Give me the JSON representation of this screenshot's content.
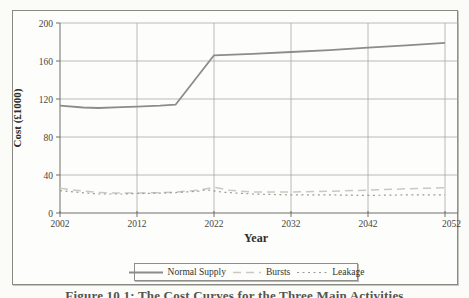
{
  "colors": {
    "paper": "#fbfbf8",
    "plot_background": "#fdfdfb",
    "gridline": "#a4a49e",
    "axis": "#6f6f69",
    "text": "#3c3c38"
  },
  "chart_data": {
    "type": "line",
    "title": "",
    "xlabel": "Year",
    "ylabel": "Cost (£1000)",
    "xlim": [
      2002,
      2052
    ],
    "ylim": [
      0,
      200
    ],
    "xticks": [
      2002,
      2012,
      2022,
      2032,
      2042,
      2052
    ],
    "yticks": [
      0,
      40,
      80,
      120,
      160,
      200
    ],
    "grid": "on",
    "legend_position": "bottom-center",
    "series": [
      {
        "name": "Normal Supply",
        "color": "#8c8c88",
        "dash": "",
        "width": 1.8,
        "points": [
          [
            2002,
            113
          ],
          [
            2005,
            111
          ],
          [
            2007,
            110.5
          ],
          [
            2010,
            111.5
          ],
          [
            2012,
            112
          ],
          [
            2015,
            113
          ],
          [
            2017,
            114
          ],
          [
            2022,
            166
          ],
          [
            2027,
            167.5
          ],
          [
            2032,
            169.5
          ],
          [
            2037,
            171.5
          ],
          [
            2042,
            174
          ],
          [
            2047,
            176.5
          ],
          [
            2052,
            179
          ]
        ]
      },
      {
        "name": "Bursts",
        "color": "#c9c9c3",
        "dash": "8 5",
        "width": 1.5,
        "points": [
          [
            2002,
            26
          ],
          [
            2004,
            24
          ],
          [
            2007,
            21.5
          ],
          [
            2010,
            21
          ],
          [
            2012,
            21
          ],
          [
            2015,
            21.5
          ],
          [
            2017,
            22
          ],
          [
            2020,
            24
          ],
          [
            2022,
            27
          ],
          [
            2024,
            24
          ],
          [
            2027,
            22
          ],
          [
            2032,
            22
          ],
          [
            2037,
            23
          ],
          [
            2042,
            24
          ],
          [
            2047,
            25.5
          ],
          [
            2052,
            26.5
          ]
        ]
      },
      {
        "name": "Leakage",
        "color": "#9c9c96",
        "dash": "2 3.5",
        "width": 1.2,
        "points": [
          [
            2002,
            23.5
          ],
          [
            2004,
            22
          ],
          [
            2007,
            20
          ],
          [
            2010,
            20
          ],
          [
            2012,
            20.5
          ],
          [
            2015,
            21
          ],
          [
            2017,
            21.5
          ],
          [
            2020,
            23
          ],
          [
            2021,
            24.5
          ],
          [
            2023,
            22
          ],
          [
            2025,
            21
          ],
          [
            2027,
            20
          ],
          [
            2032,
            19
          ],
          [
            2037,
            19
          ],
          [
            2042,
            18.5
          ],
          [
            2047,
            19
          ],
          [
            2052,
            19
          ]
        ]
      }
    ]
  },
  "caption": {
    "text": "Figure 10.1: The Cost Curves for the Three Main Activities"
  }
}
